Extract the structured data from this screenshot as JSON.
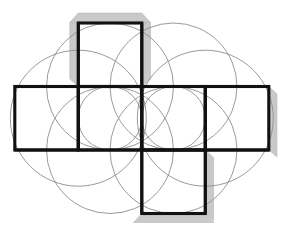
{
  "figure": {
    "canvas": {
      "width": 289,
      "height": 236,
      "background": "#ffffff"
    },
    "colors": {
      "net_stroke": "#111111",
      "circle_stroke": "#8f8f8f",
      "shadow_fill": "#c9c9c9",
      "shadow_stroke": "#b0b0b0",
      "background": "#ffffff"
    },
    "grid": {
      "cell_size": 63.5,
      "x_lines": [
        14.8,
        78.3,
        141.8,
        205.3,
        268.8
      ],
      "y_lines": [
        23.0,
        86.5,
        150.0,
        213.5
      ]
    }
  },
  "chart_data": {
    "type": "diagram",
    "squares": [
      {
        "name": "top-square",
        "col": 1,
        "row": 0,
        "x": 78.3,
        "y": 23.0,
        "w": 63.5,
        "h": 63.5
      },
      {
        "name": "left-square",
        "col": 0,
        "row": 1,
        "x": 14.8,
        "y": 86.5,
        "w": 63.5,
        "h": 63.5
      },
      {
        "name": "center-left-square",
        "col": 1,
        "row": 1,
        "x": 78.3,
        "y": 86.5,
        "w": 63.5,
        "h": 63.5
      },
      {
        "name": "center-right-square",
        "col": 2,
        "row": 1,
        "x": 141.8,
        "y": 86.5,
        "w": 63.5,
        "h": 63.5
      },
      {
        "name": "right-square",
        "col": 3,
        "row": 1,
        "x": 205.3,
        "y": 86.5,
        "w": 63.5,
        "h": 63.5
      },
      {
        "name": "bottom-square",
        "col": 2,
        "row": 2,
        "x": 141.8,
        "y": 150.0,
        "w": 63.5,
        "h": 63.5
      }
    ],
    "circles": [
      {
        "name": "circle-left-large",
        "cx": 78.3,
        "cy": 118.2,
        "r": 68.0
      },
      {
        "name": "circle-right-large",
        "cx": 205.3,
        "cy": 118.2,
        "r": 68.0
      },
      {
        "name": "circle-top-left",
        "cx": 110.0,
        "cy": 86.5,
        "r": 63.5
      },
      {
        "name": "circle-top-right",
        "cx": 173.5,
        "cy": 86.5,
        "r": 63.5
      },
      {
        "name": "circle-bottom-left",
        "cx": 110.0,
        "cy": 150.0,
        "r": 63.5
      },
      {
        "name": "circle-bottom-right",
        "cx": 173.5,
        "cy": 150.0,
        "r": 63.5
      },
      {
        "name": "circle-mid-left",
        "cx": 110.0,
        "cy": 118.2,
        "r": 31.8
      },
      {
        "name": "circle-mid-right",
        "cx": 173.5,
        "cy": 118.2,
        "r": 31.8
      }
    ],
    "shadows": [
      {
        "name": "shadow-top-square-top",
        "x": 70.0,
        "y": 13.0,
        "w": 80.0,
        "h": 10.0,
        "skew": "cap"
      },
      {
        "name": "shadow-top-square-left",
        "x": 68.5,
        "y": 22.0,
        "w": 10.0,
        "h": 64.5
      },
      {
        "name": "shadow-top-square-right",
        "x": 141.8,
        "y": 22.0,
        "w": 10.0,
        "h": 64.5
      },
      {
        "name": "shadow-right-square-right",
        "x": 268.8,
        "y": 94.0,
        "w": 8.5,
        "h": 62.0
      },
      {
        "name": "shadow-bottom-square-right",
        "x": 205.3,
        "y": 158.0,
        "w": 8.5,
        "h": 57.0
      },
      {
        "name": "shadow-bottom-square-bottom",
        "x": 134.0,
        "y": 213.5,
        "w": 80.0,
        "h": 10.5,
        "skew": "cap"
      }
    ]
  }
}
